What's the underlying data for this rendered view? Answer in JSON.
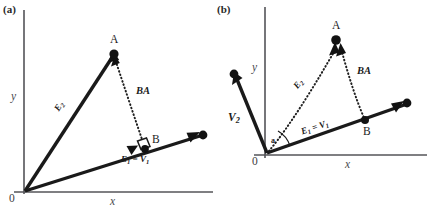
{
  "figure": {
    "caption_labels": {
      "panel_a": "(a)",
      "panel_b": "(b)"
    },
    "colors": {
      "ink": "#1a1a1a",
      "axis": "#545458",
      "background": "#ffffff"
    }
  },
  "panel_a": {
    "label": "(a)",
    "axes": {
      "x_label": "x",
      "y_label": "y",
      "origin_label": "0"
    },
    "points": [
      {
        "name": "A",
        "label": "A"
      },
      {
        "name": "B",
        "label": "B"
      }
    ],
    "vectors": [
      {
        "name": "E2",
        "label_main": "E",
        "label_sub": "2",
        "style": "solid"
      },
      {
        "name": "E1_eq_V1",
        "label": "E₁ = V₁",
        "label_parts": {
          "first": "E",
          "first_sub": "1",
          "eq": " = ",
          "second": "V",
          "second_sub": "1"
        },
        "style": "solid"
      },
      {
        "name": "BA",
        "label": "BA",
        "style": "dotted"
      }
    ],
    "markers": [
      {
        "name": "right-angle",
        "at": "B"
      }
    ]
  },
  "panel_b": {
    "label": "(b)",
    "axes": {
      "x_label": "x",
      "y_label": "y",
      "origin_label": "0"
    },
    "points": [
      {
        "name": "A",
        "label": "A"
      },
      {
        "name": "B",
        "label": "B"
      }
    ],
    "vectors": [
      {
        "name": "V2",
        "label_main": "V",
        "label_sub": "2",
        "style": "solid"
      },
      {
        "name": "E1_eq_V1",
        "label": "E₁ = V₁",
        "label_parts": {
          "first": "E",
          "first_sub": "1",
          "eq": " = ",
          "second": "V",
          "second_sub": "1"
        },
        "style": "solid"
      },
      {
        "name": "E2",
        "label_main": "E",
        "label_sub": "2",
        "style": "dotted"
      },
      {
        "name": "BA",
        "label": "BA",
        "style": "dotted"
      }
    ],
    "markers": [
      {
        "name": "angle-alpha",
        "label": "a",
        "at": "origin"
      }
    ]
  }
}
